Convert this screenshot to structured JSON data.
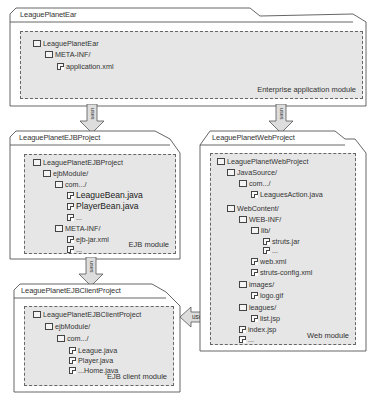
{
  "diagram": {
    "colors": {
      "module_fill": "#e6e6e6",
      "frame_stroke": "#555555",
      "arrow_fill": "#dddddd",
      "text": "#333333"
    },
    "ear": {
      "title": "LeaguePlanetEar",
      "module_label": "Enterprise application module",
      "tree": [
        {
          "label": "LeaguePlanetEar",
          "type": "folder",
          "depth": 0
        },
        {
          "label": "META-INF/",
          "type": "folder",
          "depth": 1
        },
        {
          "label": "application.xml",
          "type": "file",
          "depth": 2
        }
      ]
    },
    "ejb": {
      "title": "LeaguePlanetEJBProject",
      "module_label": "EJB module",
      "tree": [
        {
          "label": "LeaguePlanetEJBProject",
          "type": "folder",
          "depth": 0
        },
        {
          "label": "ejbModule/",
          "type": "folder",
          "depth": 1
        },
        {
          "label": "com.../",
          "type": "folder",
          "depth": 2
        },
        {
          "label": "LeagueBean.java",
          "type": "file",
          "depth": 3,
          "big": true
        },
        {
          "label": "PlayerBean.java",
          "type": "file",
          "depth": 3,
          "big": true
        },
        {
          "label": "...",
          "type": "file",
          "depth": 3
        },
        {
          "label": "META-INF/",
          "type": "folder",
          "depth": 2
        },
        {
          "label": "ejb-jar.xml",
          "type": "file",
          "depth": 3
        },
        {
          "label": "...",
          "type": "file",
          "depth": 3
        }
      ]
    },
    "ejb_client": {
      "title": "LeaguePlanetEJBClientProject",
      "module_label": "EJB client module",
      "tree": [
        {
          "label": "LeaguePlanetEJBClientProject",
          "type": "folder",
          "depth": 0
        },
        {
          "label": "ejbModule/",
          "type": "folder",
          "depth": 1
        },
        {
          "label": "com.../",
          "type": "folder",
          "depth": 2
        },
        {
          "label": "League.java",
          "type": "file",
          "depth": 3
        },
        {
          "label": "Player.java",
          "type": "file",
          "depth": 3
        },
        {
          "label": "...Home.java",
          "type": "file",
          "depth": 3
        }
      ]
    },
    "web": {
      "title": "LeaguePlanetWebProject",
      "module_label": "Web module",
      "tree": [
        {
          "label": "LeaguePlanetWebProject",
          "type": "folder",
          "depth": 0
        },
        {
          "label": "JavaSource/",
          "type": "folder",
          "depth": 1
        },
        {
          "label": "com.../",
          "type": "folder",
          "depth": 2
        },
        {
          "label": "LeaguesAction.java",
          "type": "file",
          "depth": 3
        },
        {
          "label": "WebContent/",
          "type": "folder",
          "depth": 1
        },
        {
          "label": "WEB-INF/",
          "type": "folder",
          "depth": 2
        },
        {
          "label": "lib/",
          "type": "folder",
          "depth": 3
        },
        {
          "label": "struts.jar",
          "type": "file",
          "depth": 4
        },
        {
          "label": "...",
          "type": "file",
          "depth": 4
        },
        {
          "label": "web.xml",
          "type": "file",
          "depth": 3
        },
        {
          "label": "struts-config.xml",
          "type": "file",
          "depth": 3
        },
        {
          "label": "images/",
          "type": "folder",
          "depth": 2
        },
        {
          "label": "logo.gif",
          "type": "file",
          "depth": 3
        },
        {
          "label": "leagues/",
          "type": "folder",
          "depth": 2
        },
        {
          "label": "list.jsp",
          "type": "file",
          "depth": 3
        },
        {
          "label": "index.jsp",
          "type": "file",
          "depth": 2
        },
        {
          "label": "...",
          "type": "file",
          "depth": 2
        }
      ]
    },
    "arrows": [
      {
        "id": "ear-to-ejb",
        "label": "uses",
        "direction": "down"
      },
      {
        "id": "ear-to-web",
        "label": "uses",
        "direction": "down"
      },
      {
        "id": "ejb-to-client",
        "label": "uses",
        "direction": "down"
      },
      {
        "id": "web-to-client",
        "label": "uses",
        "direction": "left"
      }
    ]
  }
}
